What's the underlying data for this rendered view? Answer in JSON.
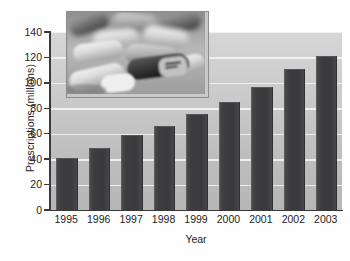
{
  "chart_data": {
    "type": "bar",
    "title": "",
    "subtitle": "",
    "xlabel": "Year",
    "ylabel": "Prescriptions (millions)",
    "categories": [
      "1995",
      "1996",
      "1997",
      "1998",
      "1999",
      "2000",
      "2001",
      "2002",
      "2003"
    ],
    "values": [
      40,
      48,
      58,
      65,
      75,
      84,
      96,
      110,
      120
    ],
    "series": [
      {
        "name": "Prescriptions (millions)",
        "values": [
          40,
          48,
          58,
          65,
          75,
          84,
          96,
          110,
          120
        ]
      }
    ],
    "ylim": [
      0,
      140
    ],
    "yticks": [
      0,
      20,
      40,
      60,
      80,
      100,
      120,
      140
    ],
    "ytick_labels": [
      "0",
      "20",
      "40",
      "60",
      "80",
      "100",
      "120",
      "140"
    ],
    "grid": true,
    "grid_axis": "y",
    "legend": false,
    "legend_position": "none",
    "annotations": [],
    "colors": {
      "bar": "#3c3c3f",
      "plot_background_top": "#d6d6d6",
      "plot_background_bottom": "#b6b6b6",
      "gridline": "#f2f2f2",
      "axis": "#3a3a3a",
      "text": "#232323",
      "figure_background": "#ffffff"
    }
  },
  "inset": {
    "name": "pills-photograph",
    "description": "Grayscale close-up photograph of prescription capsules and tablets",
    "border_color": "#8c8c8c"
  }
}
